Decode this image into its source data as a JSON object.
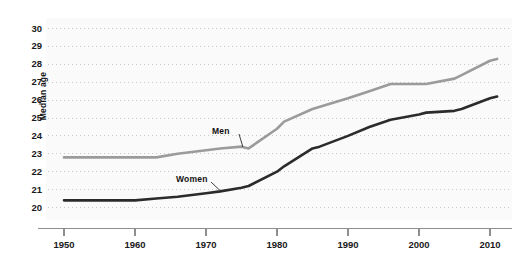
{
  "chart_data": {
    "type": "line",
    "title": "",
    "xlabel": "",
    "ylabel": "Median age",
    "xlim": [
      1947,
      2013
    ],
    "ylim": [
      19.4,
      30.4
    ],
    "grid": true,
    "grid_style": "dotted-horizontal",
    "legend_position": "inline-annotations",
    "x_ticks": [
      1950,
      1960,
      1970,
      1980,
      1990,
      2000,
      2010
    ],
    "x_tick_labels": [
      "1950",
      "1960",
      "1970",
      "1980",
      "1990",
      "2000",
      "2010"
    ],
    "y_ticks": [
      20,
      21,
      22,
      23,
      24,
      25,
      26,
      27,
      28,
      29,
      30
    ],
    "y_tick_labels": [
      "20",
      "21",
      "22",
      "23",
      "24",
      "25",
      "26",
      "27",
      "28",
      "29",
      "30"
    ],
    "series": [
      {
        "name": "Men",
        "color": "#9b9b9b",
        "x": [
          1950,
          1955,
          1960,
          1963,
          1966,
          1970,
          1972,
          1975,
          1976,
          1980,
          1981,
          1985,
          1990,
          1993,
          1996,
          2000,
          2001,
          2005,
          2006,
          2010,
          2011
        ],
        "values": [
          22.8,
          22.8,
          22.8,
          22.8,
          23.0,
          23.2,
          23.3,
          23.4,
          23.3,
          24.4,
          24.8,
          25.5,
          26.1,
          26.5,
          26.9,
          26.9,
          26.9,
          27.2,
          27.4,
          28.2,
          28.3
        ]
      },
      {
        "name": "Women",
        "color": "#2b2b2b",
        "x": [
          1950,
          1955,
          1960,
          1963,
          1966,
          1970,
          1972,
          1975,
          1976,
          1980,
          1981,
          1985,
          1986,
          1990,
          1993,
          1996,
          2000,
          2001,
          2005,
          2006,
          2010,
          2011
        ],
        "values": [
          20.4,
          20.4,
          20.4,
          20.5,
          20.6,
          20.8,
          20.9,
          21.1,
          21.2,
          22.0,
          22.3,
          23.3,
          23.4,
          24.0,
          24.5,
          24.9,
          25.2,
          25.3,
          25.4,
          25.5,
          26.1,
          26.2
        ]
      }
    ],
    "annotations": [
      {
        "text": "Men",
        "series": "Men",
        "x": 1975,
        "y": 23.4
      },
      {
        "text": "Women",
        "series": "Women",
        "x": 1972,
        "y": 20.9
      }
    ]
  },
  "axes": {
    "y_title": "Median age"
  },
  "colors": {
    "men_line": "#9b9b9b",
    "women_line": "#2b2b2b",
    "grid": "#c9c9c9",
    "axis": "#8e8e8e",
    "plot_background": "#fafafa",
    "text": "#1a1a1a"
  }
}
